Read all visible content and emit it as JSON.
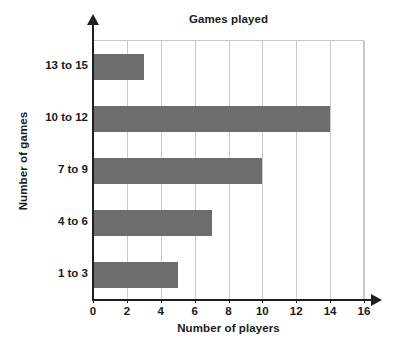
{
  "chart_data": {
    "type": "bar",
    "orientation": "horizontal",
    "title": "Games played",
    "xlabel": "Number of players",
    "ylabel": "Number of games",
    "categories": [
      "1 to 3",
      "4 to 6",
      "7 to 9",
      "10 to 12",
      "13 to 15"
    ],
    "values": [
      5,
      7,
      10,
      14,
      3
    ],
    "xlim": [
      0,
      16
    ],
    "xticks": [
      0,
      2,
      4,
      6,
      8,
      10,
      12,
      14,
      16
    ],
    "xtick_labels": [
      "0",
      "2",
      "4",
      "6",
      "8",
      "10",
      "12",
      "14",
      "16"
    ],
    "grid": "vertical",
    "legend": null,
    "colors": {
      "bar_fill": "#6d6d6d",
      "gridline": "#c9c9c9",
      "axis": "#1f1f1f",
      "text": "#1a1a1a",
      "background": "#ffffff"
    }
  }
}
